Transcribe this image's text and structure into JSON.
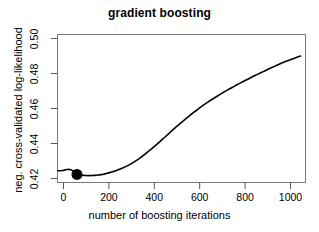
{
  "chart_data": {
    "type": "line",
    "title": "gradient boosting",
    "xlabel": "number of boosting iterations",
    "ylabel": "neg. cross-validated log-likelihood",
    "xlim": [
      0,
      1020
    ],
    "ylim": [
      0.4095,
      0.5035
    ],
    "grid": false,
    "legend": null,
    "xticks": [
      0,
      200,
      400,
      600,
      800,
      1000
    ],
    "xtick_labels": [
      "0",
      "200",
      "400",
      "600",
      "800",
      "1000"
    ],
    "yticks": [
      0.42,
      0.44,
      0.46,
      0.48,
      0.5
    ],
    "ytick_labels": [
      "0.42",
      "0.44",
      "0.46",
      "0.48",
      "0.50"
    ],
    "series": [
      {
        "name": "cv negative log-likelihood",
        "color": "#000000",
        "x": [
          1,
          10,
          20,
          30,
          40,
          50,
          60,
          70,
          80,
          90,
          100,
          110,
          120,
          130,
          140,
          150,
          160,
          170,
          180,
          190,
          200,
          220,
          240,
          260,
          280,
          300,
          320,
          340,
          360,
          380,
          400,
          420,
          440,
          460,
          480,
          500,
          520,
          540,
          560,
          580,
          600,
          620,
          640,
          660,
          680,
          700,
          720,
          740,
          760,
          780,
          800,
          820,
          840,
          860,
          880,
          900,
          920,
          940,
          960,
          980,
          1000
        ],
        "y": [
          0.417,
          0.417,
          0.4171,
          0.4175,
          0.4178,
          0.4177,
          0.4172,
          0.4162,
          0.4146,
          0.4142,
          0.4141,
          0.414,
          0.4139,
          0.4139,
          0.4139,
          0.414,
          0.4141,
          0.4143,
          0.4145,
          0.4148,
          0.4152,
          0.416,
          0.417,
          0.4182,
          0.4196,
          0.4212,
          0.4231,
          0.4252,
          0.4275,
          0.43,
          0.4326,
          0.4353,
          0.4381,
          0.4409,
          0.4437,
          0.4464,
          0.449,
          0.4515,
          0.454,
          0.4563,
          0.4586,
          0.4607,
          0.4627,
          0.4646,
          0.4665,
          0.4683,
          0.47,
          0.4717,
          0.4733,
          0.4749,
          0.4765,
          0.478,
          0.4795,
          0.481,
          0.4824,
          0.4838,
          0.4852,
          0.4865,
          0.4877,
          0.4888,
          0.4898
        ]
      }
    ],
    "markers": [
      {
        "name": "selected-optimum",
        "x": 80,
        "y": 0.4146,
        "shape": "filled-circle",
        "color": "#000000",
        "size": 5.5
      }
    ]
  }
}
